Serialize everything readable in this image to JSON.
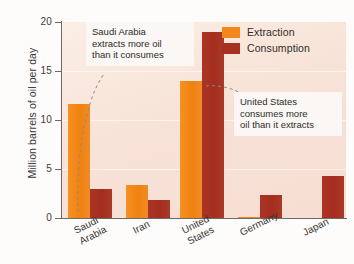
{
  "chart_data": {
    "type": "bar",
    "title": "",
    "xlabel": "",
    "ylabel": "Million barrels of oil per day",
    "ylim": [
      0,
      20
    ],
    "yticks": [
      "0",
      "5",
      "10",
      "15",
      "20"
    ],
    "grid": false,
    "legend_position": "top-right",
    "categories": [
      "Saudi\nArabia",
      "Iran",
      "United\nStates",
      "Germany",
      "Japan"
    ],
    "series": [
      {
        "name": "Extraction",
        "color": "#f3871c",
        "values": [
          11.6,
          3.4,
          14.0,
          0.15,
          0.0
        ]
      },
      {
        "name": "Consumption",
        "color": "#a8301f",
        "values": [
          3.0,
          1.8,
          19.0,
          2.3,
          4.3
        ]
      }
    ],
    "annotations": [
      {
        "id": "saudi",
        "text": "Saudi Arabia\nextracts more oil\nthan it consumes"
      },
      {
        "id": "united-states",
        "text": "United States\nconsumes more\noil than it extracts"
      }
    ]
  },
  "legend": {
    "items": [
      {
        "label": "Extraction"
      },
      {
        "label": "Consumption"
      }
    ]
  },
  "axis": {
    "y_title": "Million barrels of oil per day",
    "y_ticks": [
      "20",
      "15",
      "10",
      "5",
      "0"
    ]
  },
  "x_labels": [
    {
      "line1": "Saudi",
      "line2": "Arabia"
    },
    {
      "line1": "Iran",
      "line2": ""
    },
    {
      "line1": "United",
      "line2": "States"
    },
    {
      "line1": "Germany",
      "line2": ""
    },
    {
      "line1": "Japan",
      "line2": ""
    }
  ]
}
